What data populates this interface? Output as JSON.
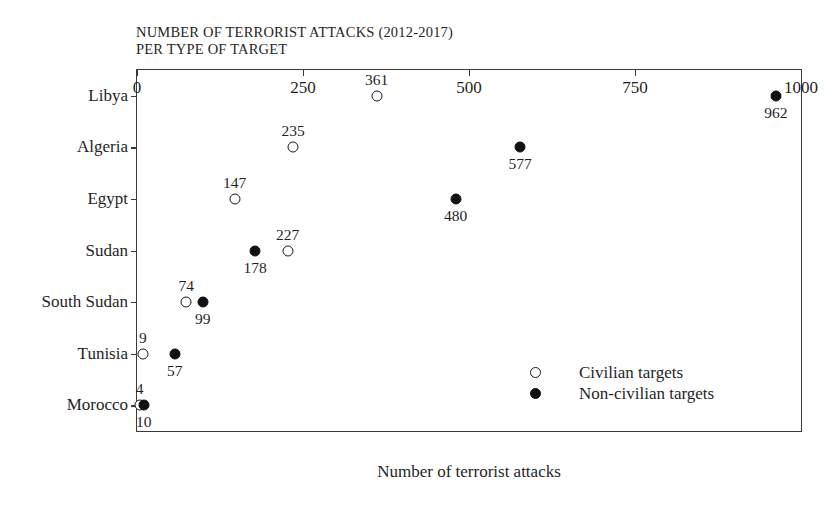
{
  "chart_data": {
    "type": "scatter",
    "title": "NUMBER OF TERRORIST ATTACKS (2012-2017)\nPER TYPE OF TARGET",
    "title_line1": "NUMBER OF TERRORIST ATTACKS (2012-2017)",
    "title_line2": "PER TYPE OF TARGET",
    "orientation": "horizontal",
    "xlabel": "Number of terrorist attacks",
    "ylabel": "",
    "xlim": [
      0,
      1000
    ],
    "xticks": [
      0,
      250,
      500,
      750,
      1000
    ],
    "xtick_labels": [
      "0",
      "250",
      "500",
      "750",
      "1000"
    ],
    "categories": [
      "Libya",
      "Algeria",
      "Egypt",
      "Sudan",
      "South Sudan",
      "Tunisia",
      "Morocco"
    ],
    "grid": false,
    "legend_position": "inside-bottom-right",
    "series": [
      {
        "name": "Civilian targets",
        "marker": "open-circle",
        "color": "#ffffff",
        "edge_color": "#1a1a1a",
        "values": [
          361,
          235,
          147,
          227,
          74,
          9,
          4
        ]
      },
      {
        "name": "Non-civilian targets",
        "marker": "filled-circle",
        "color": "#111111",
        "edge_color": "#111111",
        "values": [
          962,
          577,
          480,
          178,
          99,
          57,
          10
        ]
      }
    ],
    "points": [
      {
        "category": "Libya",
        "series": "Civilian targets",
        "value": 361,
        "label": "361",
        "label_pos": "above"
      },
      {
        "category": "Libya",
        "series": "Non-civilian targets",
        "value": 962,
        "label": "962",
        "label_pos": "below"
      },
      {
        "category": "Algeria",
        "series": "Civilian targets",
        "value": 235,
        "label": "235",
        "label_pos": "above"
      },
      {
        "category": "Algeria",
        "series": "Non-civilian targets",
        "value": 577,
        "label": "577",
        "label_pos": "below"
      },
      {
        "category": "Egypt",
        "series": "Civilian targets",
        "value": 147,
        "label": "147",
        "label_pos": "above"
      },
      {
        "category": "Egypt",
        "series": "Non-civilian targets",
        "value": 480,
        "label": "480",
        "label_pos": "below"
      },
      {
        "category": "Sudan",
        "series": "Civilian targets",
        "value": 227,
        "label": "227",
        "label_pos": "above"
      },
      {
        "category": "Sudan",
        "series": "Non-civilian targets",
        "value": 178,
        "label": "178",
        "label_pos": "below"
      },
      {
        "category": "South Sudan",
        "series": "Civilian targets",
        "value": 74,
        "label": "74",
        "label_pos": "above"
      },
      {
        "category": "South Sudan",
        "series": "Non-civilian targets",
        "value": 99,
        "label": "99",
        "label_pos": "below"
      },
      {
        "category": "Tunisia",
        "series": "Civilian targets",
        "value": 9,
        "label": "9",
        "label_pos": "above"
      },
      {
        "category": "Tunisia",
        "series": "Non-civilian targets",
        "value": 57,
        "label": "57",
        "label_pos": "below"
      },
      {
        "category": "Morocco",
        "series": "Civilian targets",
        "value": 4,
        "label": "4",
        "label_pos": "above"
      },
      {
        "category": "Morocco",
        "series": "Non-civilian targets",
        "value": 10,
        "label": "10",
        "label_pos": "below"
      }
    ],
    "legend": [
      {
        "label": "Civilian targets",
        "marker": "open-circle"
      },
      {
        "label": "Non-civilian targets",
        "marker": "filled-circle"
      }
    ]
  },
  "style": {
    "frame_color": "#3a3a3a",
    "text_color": "#1f1f1f",
    "background": "#ffffff"
  }
}
